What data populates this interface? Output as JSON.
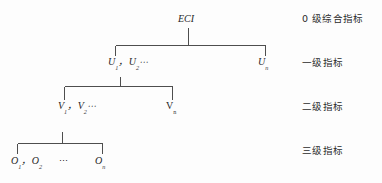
{
  "diagram": {
    "type": "hierarchy-tree",
    "background_color": "#fdfdfd",
    "line_color": "#4e4e4e",
    "text_color": "#262626",
    "root": {
      "label": "ECI"
    },
    "levels": [
      {
        "id": "level-0",
        "side_label": "0 级综合指标",
        "nodes": [
          {
            "id": "eci",
            "base": "ECI",
            "sub": "",
            "italic": true
          }
        ]
      },
      {
        "id": "level-1",
        "side_label": "一级指标",
        "nodes": [
          {
            "id": "u1",
            "base": "U",
            "sub": "1",
            "italic": true
          },
          {
            "id": "u2",
            "base": "U",
            "sub": "2",
            "italic": true
          },
          {
            "id": "un",
            "base": "U",
            "sub": "n",
            "italic": true
          }
        ],
        "separator": "，",
        "ellipsis": "⋯"
      },
      {
        "id": "level-2",
        "side_label": "二级指标",
        "nodes": [
          {
            "id": "v1",
            "base": "V",
            "sub": "1",
            "italic": true
          },
          {
            "id": "v2",
            "base": "V",
            "sub": "2",
            "italic": true
          },
          {
            "id": "vn",
            "base": "V",
            "sub": "n",
            "italic": false
          }
        ],
        "separator": "，",
        "ellipsis": "⋯"
      },
      {
        "id": "level-3",
        "side_label": "三级指标",
        "nodes": [
          {
            "id": "o1",
            "base": "O",
            "sub": "1",
            "italic": true
          },
          {
            "id": "o2",
            "base": "O",
            "sub": "2",
            "italic": true
          },
          {
            "id": "on",
            "base": "O",
            "sub": "n",
            "italic": true
          }
        ],
        "separator": "，",
        "ellipsis": "⋯"
      }
    ],
    "connectors": [
      {
        "id": "connector-0-1",
        "from": "eci",
        "span": "115-265",
        "stem_x": 188,
        "y": 45
      },
      {
        "id": "connector-1-2",
        "from": "u1",
        "span": "64-172",
        "stem_x": 120,
        "y": 86
      },
      {
        "id": "connector-2-3",
        "from": "v1",
        "span": "17-102",
        "stem_x": 62,
        "y": 143
      }
    ]
  }
}
